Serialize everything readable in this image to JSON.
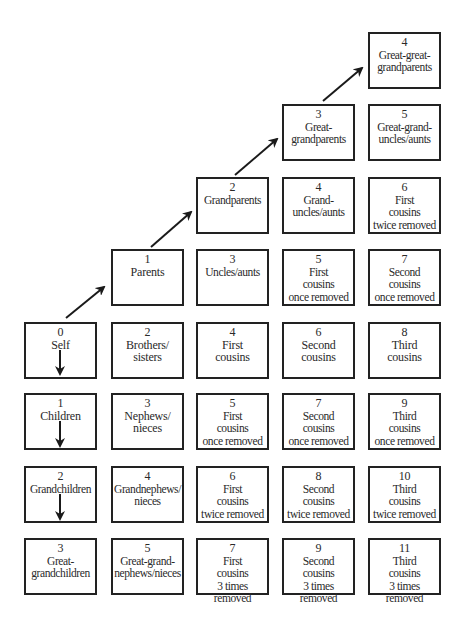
{
  "diagram": {
    "title": "",
    "colors": {
      "border": "#222222",
      "text": "#2a2a2a",
      "arrow": "#1a1a1a",
      "background": "#ffffff"
    },
    "boxes": [
      {
        "id": "self",
        "num": "0",
        "label": "Self",
        "col": 0,
        "row": 4
      },
      {
        "id": "children",
        "num": "1",
        "label": "Children",
        "col": 0,
        "row": 5
      },
      {
        "id": "grandchildren",
        "num": "2",
        "label": "Grandchildren",
        "col": 0,
        "row": 6
      },
      {
        "id": "great-grandchildren",
        "num": "3",
        "label": "Great-\ngrandchildren",
        "col": 0,
        "row": 7
      },
      {
        "id": "parents",
        "num": "1",
        "label": "Parents",
        "col": 1,
        "row": 3
      },
      {
        "id": "brothers-sisters",
        "num": "2",
        "label": "Brothers/\nsisters",
        "col": 1,
        "row": 4
      },
      {
        "id": "nephews-nieces",
        "num": "3",
        "label": "Nephews/\nnieces",
        "col": 1,
        "row": 5
      },
      {
        "id": "grandnephews-nieces",
        "num": "4",
        "label": "Grandnephews/\nnieces",
        "col": 1,
        "row": 6
      },
      {
        "id": "great-grand-nephews-nieces",
        "num": "5",
        "label": "Great-grand-\nnephews/nieces",
        "col": 1,
        "row": 7
      },
      {
        "id": "grandparents",
        "num": "2",
        "label": "Grandparents",
        "col": 2,
        "row": 2
      },
      {
        "id": "uncles-aunts",
        "num": "3",
        "label": "Uncles/aunts",
        "col": 2,
        "row": 3
      },
      {
        "id": "first-cousins",
        "num": "4",
        "label": "First\ncousins",
        "col": 2,
        "row": 4
      },
      {
        "id": "first-cousins-once-removed",
        "num": "5",
        "label": "First\ncousins\nonce removed",
        "col": 2,
        "row": 5
      },
      {
        "id": "first-cousins-twice-removed",
        "num": "6",
        "label": "First\ncousins\ntwice removed",
        "col": 2,
        "row": 6
      },
      {
        "id": "first-cousins-3-times-removed",
        "num": "7",
        "label": "First\ncousins\n3 times removed",
        "col": 2,
        "row": 7
      },
      {
        "id": "great-grandparents",
        "num": "3",
        "label": "Great-\ngrandparents",
        "col": 3,
        "row": 1
      },
      {
        "id": "grand-uncles-aunts",
        "num": "4",
        "label": "Grand-\nuncles/aunts",
        "col": 3,
        "row": 2
      },
      {
        "id": "first-cousins-once-removed-up",
        "num": "5",
        "label": "First\ncousins\nonce removed",
        "col": 3,
        "row": 3
      },
      {
        "id": "second-cousins",
        "num": "6",
        "label": "Second\ncousins",
        "col": 3,
        "row": 4
      },
      {
        "id": "second-cousins-once-removed",
        "num": "7",
        "label": "Second\ncousins\nonce removed",
        "col": 3,
        "row": 5
      },
      {
        "id": "second-cousins-twice-removed",
        "num": "8",
        "label": "Second\ncousins\ntwice removed",
        "col": 3,
        "row": 6
      },
      {
        "id": "second-cousins-3-times-removed",
        "num": "9",
        "label": "Second\ncousins\n3 times removed",
        "col": 3,
        "row": 7
      },
      {
        "id": "great-great-grandparents",
        "num": "4",
        "label": "Great-great-\ngrandparents",
        "col": 4,
        "row": 0
      },
      {
        "id": "great-grand-uncles-aunts",
        "num": "5",
        "label": "Great-grand-\nuncles/aunts",
        "col": 4,
        "row": 1
      },
      {
        "id": "first-cousins-twice-removed-up",
        "num": "6",
        "label": "First\ncousins\ntwice removed",
        "col": 4,
        "row": 2
      },
      {
        "id": "second-cousins-once-removed-up",
        "num": "7",
        "label": "Second\ncousins\nonce removed",
        "col": 4,
        "row": 3
      },
      {
        "id": "third-cousins",
        "num": "8",
        "label": "Third\ncousins",
        "col": 4,
        "row": 4
      },
      {
        "id": "third-cousins-once-removed",
        "num": "9",
        "label": "Third\ncousins\nonce removed",
        "col": 4,
        "row": 5
      },
      {
        "id": "third-cousins-twice-removed",
        "num": "10",
        "label": "Third\ncousins\ntwice removed",
        "col": 4,
        "row": 6
      },
      {
        "id": "third-cousins-3-times-removed",
        "num": "11",
        "label": "Third\ncousins\n3 times removed",
        "col": 4,
        "row": 7
      }
    ],
    "arrows_up": [
      {
        "from": "self",
        "to": "parents"
      },
      {
        "from": "parents",
        "to": "grandparents"
      },
      {
        "from": "grandparents",
        "to": "great-grandparents"
      },
      {
        "from": "great-grandparents",
        "to": "great-great-grandparents"
      }
    ],
    "arrows_down": [
      {
        "in": "self"
      },
      {
        "in": "children"
      },
      {
        "in": "grandchildren"
      }
    ]
  }
}
